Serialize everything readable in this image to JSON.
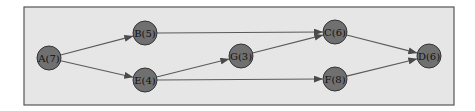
{
  "diagram": {
    "type": "directed-graph",
    "colors": {
      "background": "#e6e6e6",
      "frame": "#555555",
      "node_fill": "#707070",
      "node_stroke": "#333333",
      "edge": "#5a5a5a"
    },
    "nodes": [
      {
        "id": "A",
        "label": "A(7)",
        "x": 49,
        "y": 58
      },
      {
        "id": "B",
        "label": "B(5)",
        "x": 145,
        "y": 33
      },
      {
        "id": "E",
        "label": "E(4)",
        "x": 145,
        "y": 80
      },
      {
        "id": "G",
        "label": "G(3)",
        "x": 241,
        "y": 56
      },
      {
        "id": "C",
        "label": "C(6)",
        "x": 335,
        "y": 32
      },
      {
        "id": "F",
        "label": "F(8)",
        "x": 335,
        "y": 79
      },
      {
        "id": "D",
        "label": "D(6)",
        "x": 429,
        "y": 56
      }
    ],
    "edges": [
      {
        "from": "A",
        "to": "B"
      },
      {
        "from": "A",
        "to": "E"
      },
      {
        "from": "B",
        "to": "C"
      },
      {
        "from": "E",
        "to": "G"
      },
      {
        "from": "E",
        "to": "F"
      },
      {
        "from": "G",
        "to": "C"
      },
      {
        "from": "C",
        "to": "D"
      },
      {
        "from": "F",
        "to": "D"
      }
    ]
  }
}
